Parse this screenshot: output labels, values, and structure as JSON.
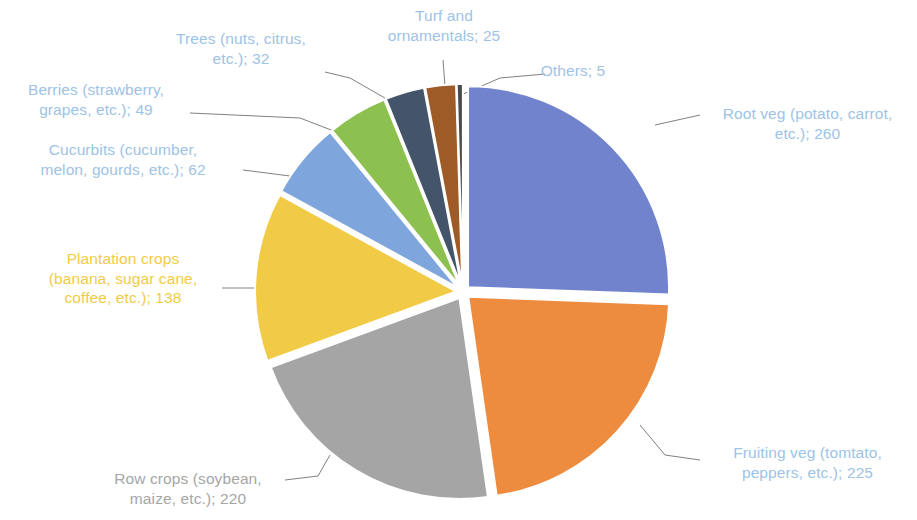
{
  "chart_data": {
    "type": "pie",
    "title": "",
    "total": 1016,
    "start_angle_deg": 0,
    "direction": "clockwise",
    "explode": true,
    "legend": "none",
    "labels_outside": true,
    "label_format": "name; value",
    "categories": [
      "Root veg (potato, carrot, etc.)",
      "Fruiting veg (tomtato, peppers, etc.)",
      "Row crops (soybean, maize, etc.)",
      "Plantation crops (banana, sugar cane, coffee, etc.)",
      "Cucurbits (cucumber, melon, gourds, etc.)",
      "Berries (strawberry, grapes, etc.)",
      "Trees (nuts, citrus, etc.)",
      "Turf and ornamentals",
      "Others"
    ],
    "values": [
      260,
      225,
      220,
      138,
      62,
      49,
      32,
      25,
      5
    ],
    "colors": [
      "#7083cc",
      "#ed8b3f",
      "#a5a5a5",
      "#f2cb46",
      "#7ea6dc",
      "#8cc04f",
      "#44546a",
      "#9e5b28",
      "#4b4b4b"
    ],
    "slices": [
      {
        "name": "Root veg (potato, carrot, etc.)",
        "value": 260,
        "color": "#7083cc",
        "label_text": "Root veg (potato, carrot,\netc.); 260",
        "label_color": "#9dc3e6"
      },
      {
        "name": "Fruiting veg (tomtato, peppers, etc.)",
        "value": 225,
        "color": "#ed8b3f",
        "label_text": "Fruiting veg (tomtato,\npeppers, etc.); 225",
        "label_color": "#9dc3e6"
      },
      {
        "name": "Row crops (soybean, maize, etc.)",
        "value": 220,
        "color": "#a5a5a5",
        "label_text": "Row crops (soybean,\nmaize, etc.); 220",
        "label_color": "#a6a6a6"
      },
      {
        "name": "Plantation crops (banana, sugar cane, coffee, etc.)",
        "value": 138,
        "color": "#f2cb46",
        "label_text": "Plantation crops\n(banana, sugar cane,\ncoffee, etc.); 138",
        "label_color": "#f2cb46"
      },
      {
        "name": "Cucurbits (cucumber, melon, gourds, etc.)",
        "value": 62,
        "color": "#7ea6dc",
        "label_text": "Cucurbits (cucumber,\nmelon, gourds, etc.); 62",
        "label_color": "#9dc3e6"
      },
      {
        "name": "Berries (strawberry, grapes, etc.)",
        "value": 49,
        "color": "#8cc04f",
        "label_text": "Berries (strawberry,\ngrapes, etc.); 49",
        "label_color": "#9dc3e6"
      },
      {
        "name": "Trees (nuts, citrus, etc.)",
        "value": 32,
        "color": "#44546a",
        "label_text": "Trees (nuts, citrus,\netc.); 32",
        "label_color": "#9dc3e6"
      },
      {
        "name": "Turf and ornamentals",
        "value": 25,
        "color": "#9e5b28",
        "label_text": "Turf and\nornamentals; 25",
        "label_color": "#9dc3e6"
      },
      {
        "name": "Others",
        "value": 5,
        "color": "#4b4b4b",
        "label_text": "Others; 5",
        "label_color": "#9dc3e6"
      }
    ]
  },
  "labels": {
    "root_veg": "Root veg (potato, carrot,\netc.); 260",
    "fruiting_veg": "Fruiting veg (tomtato,\npeppers, etc.); 225",
    "row_crops": "Row crops (soybean,\nmaize, etc.); 220",
    "plantation": "Plantation crops\n(banana, sugar cane,\ncoffee, etc.); 138",
    "cucurbits": "Cucurbits (cucumber,\nmelon, gourds, etc.); 62",
    "berries": "Berries (strawberry,\ngrapes, etc.); 49",
    "trees": "Trees (nuts, citrus,\netc.); 32",
    "turf": "Turf and\nornamentals; 25",
    "others": "Others; 5"
  }
}
